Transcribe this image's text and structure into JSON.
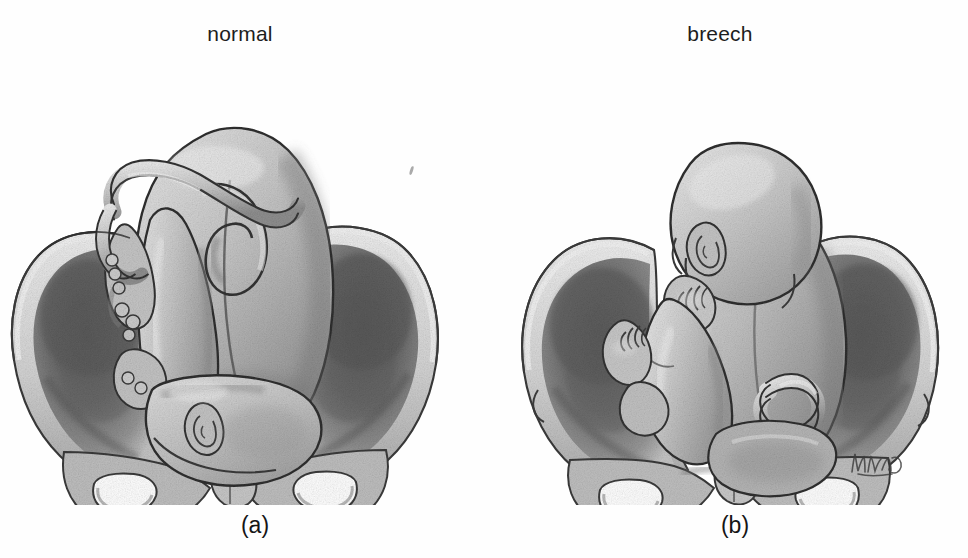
{
  "figure": {
    "medium": "graphite pencil illustration",
    "background_color": "#fefefe",
    "ink_color": "#2a2a2a"
  },
  "panels": [
    {
      "id": "normal",
      "label": "normal",
      "caption": "(a)",
      "presentation": "cephalic (vertex) presentation",
      "description": "Fetus head-down with the head engaged in the pelvic inlet; buttocks uppermost and umbilical cord looping across the back.",
      "structures": [
        "fetal head engaged in pelvic inlet",
        "fetal ear",
        "fetal buttocks",
        "umbilical cord loop",
        "left ilium",
        "right ilium",
        "sacral promontory",
        "pubic symphysis",
        "obturator foramen left",
        "obturator foramen right",
        "ischial tuberosity"
      ]
    },
    {
      "id": "breech",
      "label": "breech",
      "caption": "(b)",
      "presentation": "breech presentation",
      "description": "Fetus head-up with back toward the viewer, buttocks and flexed legs presenting at the pelvic inlet; hand raised near the face and foot visible at the left.",
      "structures": [
        "fetal head uppermost",
        "fetal ear",
        "fetal hand and fingers",
        "fetal foot and toes",
        "flexed knee",
        "fetal buttocks at pelvic inlet",
        "umbilical cord coil",
        "left ilium",
        "right ilium",
        "pubic symphysis",
        "obturator foramen left",
        "obturator foramen right"
      ]
    }
  ],
  "signature": {
    "present": true,
    "description": "cursive artist monogram, lower right of panel b"
  },
  "palette": {
    "outline": "#2b2b2b",
    "body_light": "#cfcfcf",
    "body_mid": "#b0b0b0",
    "body_shadow": "#8a8a8a",
    "fossa_dark": "#6e6e6e",
    "fossa_deep": "#565656",
    "bone_rim": "#d8d8d8",
    "highlight": "#f4f4f4",
    "paper": "#fefefe"
  }
}
